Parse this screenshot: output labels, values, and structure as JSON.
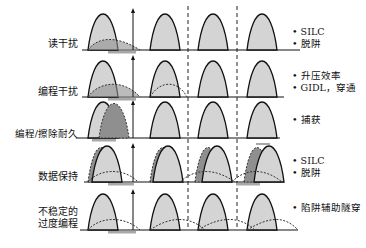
{
  "rows": [
    {
      "label": "读干扰",
      "notes": [
        "• SILC",
        "• 脱阱"
      ]
    },
    {
      "label": "编程干扰",
      "notes": [
        "• 升压效率",
        "• GIDL，穿通"
      ]
    },
    {
      "label": "编程/擦除耐久",
      "notes": [
        "• 捕获"
      ]
    },
    {
      "label": "数据保持",
      "notes": [
        "• SILC",
        "• 脱阱"
      ]
    },
    {
      "label_line1": "不稳定的",
      "label_line2": "过度编程",
      "notes": [
        "• 陷阱辅助隧穿"
      ]
    }
  ],
  "colors": {
    "fill_light": "#d4d4d4",
    "fill_dark": "#8f8f8f",
    "line": "#111111",
    "arrow_bar": "#a8a8a8"
  }
}
